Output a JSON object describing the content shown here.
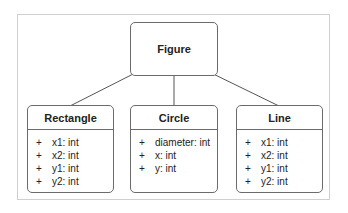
{
  "diagram": {
    "type": "uml-class-inheritance",
    "parent": {
      "name": "Figure"
    },
    "children": [
      {
        "name": "Rectangle",
        "attributes": [
          {
            "visibility": "+",
            "text": "x1: int"
          },
          {
            "visibility": "+",
            "text": "x2: int"
          },
          {
            "visibility": "+",
            "text": "y1: int"
          },
          {
            "visibility": "+",
            "text": "y2: int"
          }
        ]
      },
      {
        "name": "Circle",
        "attributes": [
          {
            "visibility": "+",
            "text": "diameter: int"
          },
          {
            "visibility": "+",
            "text": "x: int"
          },
          {
            "visibility": "+",
            "text": "y: int"
          }
        ]
      },
      {
        "name": "Line",
        "attributes": [
          {
            "visibility": "+",
            "text": "x1: int"
          },
          {
            "visibility": "+",
            "text": "x2: int"
          },
          {
            "visibility": "+",
            "text": "y1: int"
          },
          {
            "visibility": "+",
            "text": "y2: int"
          }
        ]
      }
    ],
    "edges": [
      {
        "from": "Rectangle",
        "to": "Figure",
        "arrow": "filled-triangle"
      },
      {
        "from": "Circle",
        "to": "Figure",
        "arrow": "filled-triangle"
      },
      {
        "from": "Line",
        "to": "Figure",
        "arrow": "filled-triangle"
      }
    ],
    "colors": {
      "border": "#6b6b6b",
      "frame": "#cfcfcf",
      "text": "#222222"
    }
  }
}
